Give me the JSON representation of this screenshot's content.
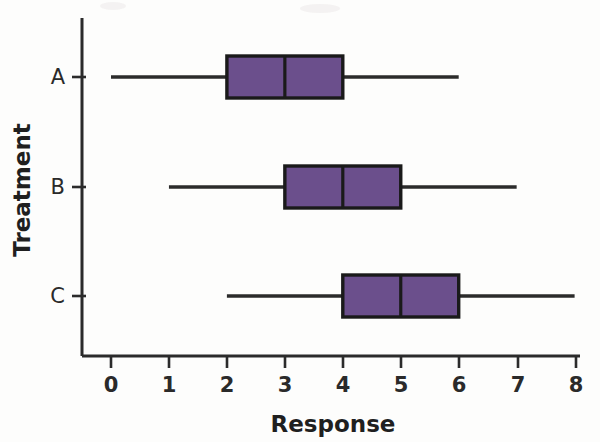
{
  "chart_data": {
    "type": "box",
    "title": "",
    "xlabel": "Response",
    "ylabel": "Treatment",
    "orientation": "horizontal",
    "xlim": [
      0,
      8
    ],
    "xticks": [
      0,
      1,
      2,
      3,
      4,
      5,
      6,
      7,
      8
    ],
    "xtick_labels": [
      "0",
      "1",
      "2",
      "3",
      "4",
      "5",
      "6",
      "7",
      "8"
    ],
    "categories": [
      "A",
      "B",
      "C"
    ],
    "grid": false,
    "legend": null,
    "box_fill_color": "#6B4F8C",
    "box_edge_color": "#1a1a1a",
    "axis_color": "#2b2b2b",
    "boxes": [
      {
        "category": "A",
        "whisker_low": 0,
        "q1": 2,
        "median": 3,
        "q3": 4,
        "whisker_high": 6
      },
      {
        "category": "B",
        "whisker_low": 1,
        "q1": 3,
        "median": 4,
        "q3": 5,
        "whisker_high": 7
      },
      {
        "category": "C",
        "whisker_low": 2,
        "q1": 4,
        "median": 5,
        "q3": 6,
        "whisker_high": 8
      }
    ]
  }
}
